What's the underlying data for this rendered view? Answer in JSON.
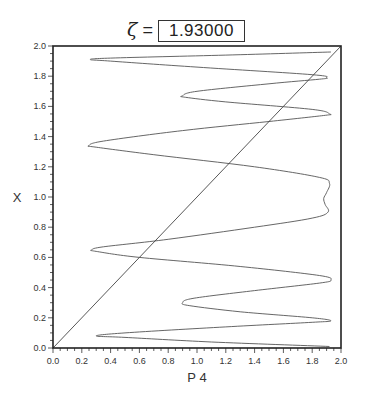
{
  "chart_data": {
    "type": "line",
    "title": {
      "symbol": "ζ",
      "equals": "=",
      "value": "1.93000"
    },
    "xlabel": "P 4",
    "ylabel": "X",
    "xlim": [
      0.0,
      2.0
    ],
    "ylim": [
      0.0,
      2.0
    ],
    "grid": false,
    "legend": null,
    "x_ticks": [
      "0.0",
      "0.2",
      "0.4",
      "0.6",
      "0.8",
      "1.0",
      "1.2",
      "1.4",
      "1.6",
      "1.8",
      "2.0"
    ],
    "y_ticks": [
      "0.0",
      "0.2",
      "0.4",
      "0.6",
      "0.8",
      "1.0",
      "1.2",
      "1.4",
      "1.6",
      "1.8",
      "2.0"
    ],
    "series": [
      {
        "name": "diagonal",
        "x": [
          0.0,
          2.0
        ],
        "y": [
          0.0,
          2.0
        ]
      },
      {
        "name": "P4(X) curve",
        "points": [
          [
            1.92,
            0.01
          ],
          [
            1.1,
            0.04
          ],
          [
            0.5,
            0.07
          ],
          [
            0.3,
            0.08
          ],
          [
            0.5,
            0.1
          ],
          [
            1.2,
            0.14
          ],
          [
            1.8,
            0.17
          ],
          [
            1.93,
            0.18
          ],
          [
            1.8,
            0.2
          ],
          [
            1.3,
            0.24
          ],
          [
            0.95,
            0.28
          ],
          [
            0.9,
            0.3
          ],
          [
            0.98,
            0.33
          ],
          [
            1.4,
            0.38
          ],
          [
            1.85,
            0.43
          ],
          [
            1.93,
            0.45
          ],
          [
            1.85,
            0.48
          ],
          [
            1.3,
            0.54
          ],
          [
            0.6,
            0.6
          ],
          [
            0.3,
            0.64
          ],
          [
            0.27,
            0.65
          ],
          [
            0.35,
            0.67
          ],
          [
            0.8,
            0.72
          ],
          [
            1.4,
            0.8
          ],
          [
            1.8,
            0.86
          ],
          [
            1.91,
            0.9
          ],
          [
            1.89,
            0.95
          ],
          [
            1.88,
            0.99
          ],
          [
            1.9,
            1.03
          ],
          [
            1.92,
            1.09
          ],
          [
            1.85,
            1.13
          ],
          [
            1.4,
            1.2
          ],
          [
            0.7,
            1.28
          ],
          [
            0.3,
            1.33
          ],
          [
            0.25,
            1.34
          ],
          [
            0.35,
            1.37
          ],
          [
            0.9,
            1.44
          ],
          [
            1.5,
            1.5
          ],
          [
            1.88,
            1.54
          ],
          [
            1.92,
            1.55
          ],
          [
            1.8,
            1.58
          ],
          [
            1.2,
            1.63
          ],
          [
            0.92,
            1.66
          ],
          [
            0.9,
            1.67
          ],
          [
            1.0,
            1.7
          ],
          [
            1.5,
            1.75
          ],
          [
            1.85,
            1.78
          ],
          [
            1.9,
            1.79
          ],
          [
            1.8,
            1.81
          ],
          [
            1.0,
            1.86
          ],
          [
            0.4,
            1.9
          ],
          [
            0.26,
            1.91
          ],
          [
            0.4,
            1.92
          ],
          [
            1.2,
            1.94
          ],
          [
            1.93,
            1.96
          ]
        ]
      }
    ]
  }
}
